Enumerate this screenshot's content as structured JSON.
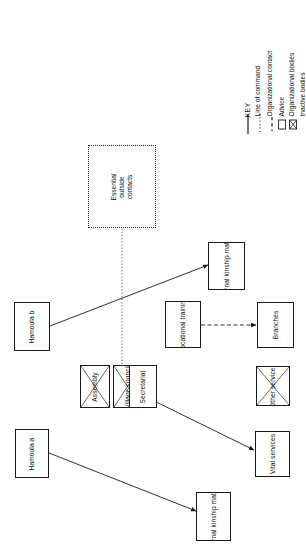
{
  "diagram": {
    "orientation": "rotated-90",
    "colors": {
      "line": "#1a1a1a",
      "background": "#ffffff",
      "text": "#111111"
    },
    "key": {
      "heading": "KEY",
      "entries": [
        {
          "label": "Line of command",
          "symbol": "solid-line"
        },
        {
          "label": "Organizational contact",
          "symbol": "dotted-line"
        },
        {
          "label": "Advice",
          "symbol": "dashed-line"
        },
        {
          "label": "Organizational bodies",
          "symbol": "empty-box"
        },
        {
          "label": "Inactive bodies",
          "symbol": "crosshatched-box"
        }
      ]
    },
    "nodes": [
      {
        "id": "hamoula_b",
        "label": "Hamoula b",
        "type": "organizational"
      },
      {
        "id": "hamoula_a",
        "label": "Hamoula a",
        "type": "organizational"
      },
      {
        "id": "assembly",
        "label": "Assembly",
        "type": "inactive"
      },
      {
        "id": "village_council",
        "label": "Village\ncouncil",
        "type": "inactive"
      },
      {
        "id": "secretariat",
        "label": "Secretariat",
        "type": "organizational"
      },
      {
        "id": "kinship_top",
        "label": "Internal\nkinship\nmatters",
        "type": "organizational"
      },
      {
        "id": "kinship_bottom",
        "label": "Internal\nkinship\nmatters",
        "type": "organizational"
      },
      {
        "id": "vocational",
        "label": "Vocational\ntraining",
        "type": "organizational"
      },
      {
        "id": "branches",
        "label": "Branches",
        "type": "organizational"
      },
      {
        "id": "other_services",
        "label": "Other\nservices",
        "type": "inactive"
      },
      {
        "id": "vital_services",
        "label": "Vital\nservices",
        "type": "organizational"
      },
      {
        "id": "outside_contacts",
        "label": "Essential\noutside\ncontacts",
        "type": "dotted-container"
      }
    ],
    "links": [
      {
        "from": "hamoula_b",
        "to": "kinship_top",
        "style": "line-of-command"
      },
      {
        "from": "hamoula_a",
        "to": "kinship_bottom",
        "style": "line-of-command"
      },
      {
        "from": "secretariat",
        "to": "vital_services",
        "style": "line-of-command"
      },
      {
        "from": "vocational",
        "to": "branches",
        "style": "advice"
      },
      {
        "from": "village_council",
        "to": "outside_contacts",
        "style": "organizational-contact"
      }
    ]
  }
}
